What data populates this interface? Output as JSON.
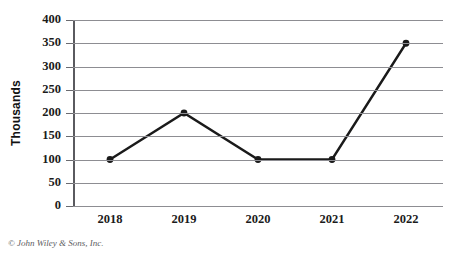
{
  "chart_data": {
    "type": "line",
    "title": "",
    "xlabel": "",
    "ylabel": "Thousands",
    "categories": [
      "2018",
      "2019",
      "2020",
      "2021",
      "2022"
    ],
    "values": [
      100,
      200,
      100,
      100,
      350
    ],
    "series": [
      {
        "name": "",
        "values": [
          100,
          200,
          100,
          100,
          350
        ]
      }
    ],
    "ylim": [
      0,
      400
    ],
    "yticks": [
      0,
      50,
      100,
      150,
      200,
      250,
      300,
      350,
      400
    ],
    "ytick_labels": [
      "0",
      "50",
      "100",
      "150",
      "200",
      "250",
      "300",
      "350",
      "400"
    ],
    "grid": "horizontal",
    "legend": "none",
    "marker": "circle",
    "line_color": "#1a1a1a",
    "grid_color": "#8d8d92"
  },
  "footer": {
    "copyright": "© John Wiley & Sons, Inc."
  }
}
